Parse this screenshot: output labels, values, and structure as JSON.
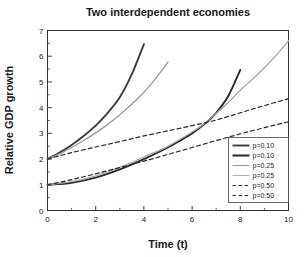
{
  "chart_data": {
    "type": "line",
    "title": "Two interdependent economies",
    "xlabel": "Time (t)",
    "ylabel": "Relative GDP growth",
    "xlim": [
      0,
      10
    ],
    "ylim": [
      0,
      7
    ],
    "xticks": [
      "0",
      "2",
      "4",
      "6",
      "8",
      "10"
    ],
    "xtick_values": [
      0,
      2,
      4,
      6,
      8,
      10
    ],
    "yticks": [
      "0",
      "1",
      "2",
      "3",
      "4",
      "5",
      "6",
      "7"
    ],
    "ytick_values": [
      0,
      1,
      2,
      3,
      4,
      5,
      6,
      7
    ],
    "grid": false,
    "legend_position": "lower right",
    "series": [
      {
        "name": "p=0.10 (upper)",
        "label": "p=0.10",
        "color": "#3d3d3d",
        "width": 1.9,
        "dash": "none",
        "x": [
          0,
          0.5,
          1,
          1.5,
          2,
          2.5,
          3,
          3.5,
          4
        ],
        "y": [
          2.0,
          2.25,
          2.55,
          2.9,
          3.3,
          3.8,
          4.4,
          5.3,
          6.47
        ]
      },
      {
        "name": "p=0.10 (lower)",
        "label": "p=0.10",
        "color": "#2b2b2b",
        "width": 1.9,
        "dash": "none",
        "x": [
          0,
          1,
          2,
          3,
          4,
          5,
          5.5,
          6,
          6.5,
          7,
          7.5,
          8
        ],
        "y": [
          1.0,
          1.08,
          1.28,
          1.6,
          2.0,
          2.45,
          2.72,
          3.0,
          3.35,
          3.8,
          4.45,
          5.47
        ]
      },
      {
        "name": "p=0.25 (upper)",
        "label": "p=0.25",
        "color": "#9a9a9a",
        "width": 1.3,
        "dash": "none",
        "x": [
          0,
          0.5,
          1,
          1.5,
          2,
          2.5,
          3,
          3.5,
          4,
          4.5,
          5
        ],
        "y": [
          2.0,
          2.2,
          2.45,
          2.72,
          3.02,
          3.35,
          3.72,
          4.14,
          4.6,
          5.15,
          5.77
        ]
      },
      {
        "name": "p=0.25 (lower)",
        "label": "p=0.25",
        "color": "#a6a6a6",
        "width": 1.3,
        "dash": "none",
        "x": [
          0,
          1,
          2,
          3,
          4,
          5,
          6,
          6.5,
          7,
          7.5,
          8,
          8.5,
          9,
          9.5,
          10
        ],
        "y": [
          1.0,
          1.12,
          1.35,
          1.68,
          2.08,
          2.5,
          3.05,
          3.38,
          3.78,
          4.2,
          4.68,
          5.1,
          5.55,
          6.05,
          6.6
        ]
      },
      {
        "name": "p=0.50 (upper)",
        "label": "p=0.50",
        "color": "#2b2b2b",
        "width": 1.2,
        "dash": "4,3",
        "x": [
          0,
          1,
          2,
          3,
          4,
          5,
          6,
          7,
          8,
          9,
          10
        ],
        "y": [
          2.0,
          2.25,
          2.47,
          2.68,
          2.9,
          3.1,
          3.3,
          3.52,
          3.8,
          4.08,
          4.35
        ]
      },
      {
        "name": "p=0.50 (lower)",
        "label": "p=0.50",
        "color": "#2b2b2b",
        "width": 1.2,
        "dash": "4,3",
        "x": [
          0,
          1,
          2,
          3,
          4,
          5,
          6,
          7,
          8,
          9,
          10
        ],
        "y": [
          1.0,
          1.2,
          1.43,
          1.67,
          1.92,
          2.18,
          2.45,
          2.72,
          2.98,
          3.22,
          3.45
        ]
      }
    ],
    "legend": [
      {
        "label": "p=0.10",
        "color": "#3d3d3d",
        "width": 1.9,
        "dash": "none"
      },
      {
        "label": "p=0.10",
        "color": "#2b2b2b",
        "width": 2.1,
        "dash": "none"
      },
      {
        "label": "p=0.25",
        "color": "#9a9a9a",
        "width": 1.1,
        "dash": "none"
      },
      {
        "label": "p=0.25",
        "color": "#b0b0b0",
        "width": 1.1,
        "dash": "none"
      },
      {
        "label": "p=0.50",
        "color": "#2b2b2b",
        "width": 1.1,
        "dash": "3.5,2.5"
      },
      {
        "label": "p=0.50",
        "color": "#2b2b2b",
        "width": 1.1,
        "dash": "3.5,2.5"
      }
    ]
  }
}
